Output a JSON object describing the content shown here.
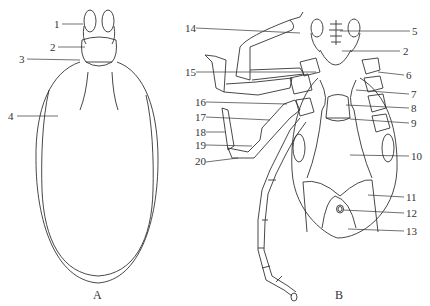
{
  "figure": {
    "panel_a": {
      "caption": "A",
      "labels": [
        {
          "id": "1",
          "text": "1",
          "x": 54,
          "y": 19
        },
        {
          "id": "2",
          "text": "2",
          "x": 50,
          "y": 41
        },
        {
          "id": "3",
          "text": "3",
          "x": 19,
          "y": 55
        },
        {
          "id": "4",
          "text": "4",
          "x": 8,
          "y": 111
        }
      ]
    },
    "panel_b": {
      "caption": "B",
      "labels": [
        {
          "id": "5",
          "text": "5",
          "x": 412,
          "y": 26
        },
        {
          "id": "2",
          "text": "2",
          "x": 402,
          "y": 46
        },
        {
          "id": "6",
          "text": "6",
          "x": 406,
          "y": 70
        },
        {
          "id": "7",
          "text": "7",
          "x": 411,
          "y": 89
        },
        {
          "id": "8",
          "text": "8",
          "x": 411,
          "y": 103
        },
        {
          "id": "9",
          "text": "9",
          "x": 411,
          "y": 118
        },
        {
          "id": "10",
          "text": "10",
          "x": 411,
          "y": 151
        },
        {
          "id": "11",
          "text": "11",
          "x": 406,
          "y": 193
        },
        {
          "id": "12",
          "text": "12",
          "x": 406,
          "y": 208
        },
        {
          "id": "13",
          "text": "13",
          "x": 406,
          "y": 226
        },
        {
          "id": "14",
          "text": "14",
          "x": 185,
          "y": 23
        },
        {
          "id": "15",
          "text": "15",
          "x": 185,
          "y": 67
        },
        {
          "id": "16",
          "text": "16",
          "x": 195,
          "y": 97
        },
        {
          "id": "17",
          "text": "17",
          "x": 195,
          "y": 112
        },
        {
          "id": "18",
          "text": "18",
          "x": 195,
          "y": 127
        },
        {
          "id": "19",
          "text": "19",
          "x": 195,
          "y": 140
        },
        {
          "id": "20",
          "text": "20",
          "x": 195,
          "y": 156
        }
      ]
    }
  }
}
